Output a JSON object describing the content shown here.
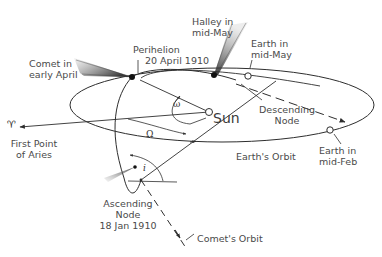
{
  "diagram": {
    "labels": {
      "comet_early_april": [
        "Comet in",
        "early April"
      ],
      "perihelion": [
        "Perihelion",
        "20 April 1910"
      ],
      "halley_mid_may": [
        "Halley in",
        "mid-May"
      ],
      "earth_mid_may": [
        "Earth in",
        "mid-May"
      ],
      "descending_node": [
        "Descending",
        "Node"
      ],
      "sun": "Sun",
      "first_point_of_aries": [
        "First Point",
        "of Aries"
      ],
      "aries_symbol": "♈",
      "earths_orbit": "Earth's Orbit",
      "earth_mid_feb": [
        "Earth in",
        "mid-Feb"
      ],
      "ascending_node": [
        "Ascending",
        "Node",
        "18 Jan 1910"
      ],
      "comets_orbit": "Comet's Orbit"
    },
    "angles": {
      "argument_of_perihelion": "ω",
      "longitude_of_ascending_node": "Ω",
      "inclination": "i"
    },
    "colors": {
      "line": "#2e2e2e",
      "text": "#4a4a4a",
      "background": "#ffffff"
    }
  }
}
